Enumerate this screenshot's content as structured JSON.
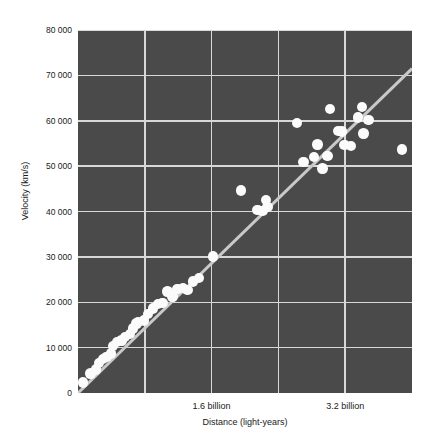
{
  "chart_data": {
    "type": "scatter",
    "title": "",
    "xlabel": "Distance (light-years)",
    "ylabel": "Velocity (km/s)",
    "xlim": [
      0,
      4000000000
    ],
    "ylim": [
      0,
      80000
    ],
    "grid": true,
    "legend": false,
    "x_tick_labels": [
      "1.6 billion",
      "3.2 billion"
    ],
    "x_tick_values": [
      1600000000,
      3200000000
    ],
    "y_tick_labels": [
      "0",
      "10 000",
      "20 000",
      "30 000",
      "40 000",
      "50 000",
      "60 000",
      "70 000",
      "80 000"
    ],
    "y_tick_values": [
      0,
      10000,
      20000,
      30000,
      40000,
      50000,
      60000,
      70000,
      80000
    ],
    "point_color": "#fbfbfb",
    "plot_background": "#4a4a4a",
    "grid_color": "#d8d8d8",
    "trendline_color": "#c9c9c9",
    "trendline": {
      "x0": 0,
      "y0": 0,
      "x1": 4000000000,
      "y1": 71500
    },
    "points": [
      {
        "x": 60000000,
        "y": 2300
      },
      {
        "x": 150000000,
        "y": 4300
      },
      {
        "x": 215000000,
        "y": 5200
      },
      {
        "x": 255000000,
        "y": 6600
      },
      {
        "x": 300000000,
        "y": 7500
      },
      {
        "x": 340000000,
        "y": 8000
      },
      {
        "x": 395000000,
        "y": 8700
      },
      {
        "x": 420000000,
        "y": 10300
      },
      {
        "x": 470000000,
        "y": 11200
      },
      {
        "x": 520000000,
        "y": 11600
      },
      {
        "x": 560000000,
        "y": 12400
      },
      {
        "x": 620000000,
        "y": 13000
      },
      {
        "x": 660000000,
        "y": 14200
      },
      {
        "x": 700000000,
        "y": 15300
      },
      {
        "x": 720000000,
        "y": 15600
      },
      {
        "x": 790000000,
        "y": 16000
      },
      {
        "x": 840000000,
        "y": 17400
      },
      {
        "x": 900000000,
        "y": 18600
      },
      {
        "x": 960000000,
        "y": 19600
      },
      {
        "x": 1010000000,
        "y": 19900
      },
      {
        "x": 1070000000,
        "y": 22400
      },
      {
        "x": 1130000000,
        "y": 21300
      },
      {
        "x": 1190000000,
        "y": 22900
      },
      {
        "x": 1260000000,
        "y": 23100
      },
      {
        "x": 1310000000,
        "y": 22700
      },
      {
        "x": 1380000000,
        "y": 24600
      },
      {
        "x": 1450000000,
        "y": 25400
      },
      {
        "x": 1620000000,
        "y": 30100
      },
      {
        "x": 1950000000,
        "y": 44600
      },
      {
        "x": 2150000000,
        "y": 40300
      },
      {
        "x": 2210000000,
        "y": 40100
      },
      {
        "x": 2250000000,
        "y": 42600
      },
      {
        "x": 2270000000,
        "y": 41000
      },
      {
        "x": 2620000000,
        "y": 59500
      },
      {
        "x": 2700000000,
        "y": 50900
      },
      {
        "x": 2830000000,
        "y": 52000
      },
      {
        "x": 2870000000,
        "y": 54800
      },
      {
        "x": 2930000000,
        "y": 49500
      },
      {
        "x": 2990000000,
        "y": 52200
      },
      {
        "x": 3020000000,
        "y": 62600
      },
      {
        "x": 3120000000,
        "y": 57800
      },
      {
        "x": 3160000000,
        "y": 57600
      },
      {
        "x": 3190000000,
        "y": 54700
      },
      {
        "x": 3270000000,
        "y": 54500
      },
      {
        "x": 3350000000,
        "y": 60700
      },
      {
        "x": 3400000000,
        "y": 63000
      },
      {
        "x": 3420000000,
        "y": 57200
      },
      {
        "x": 3480000000,
        "y": 60200
      },
      {
        "x": 3880000000,
        "y": 53700
      }
    ]
  }
}
